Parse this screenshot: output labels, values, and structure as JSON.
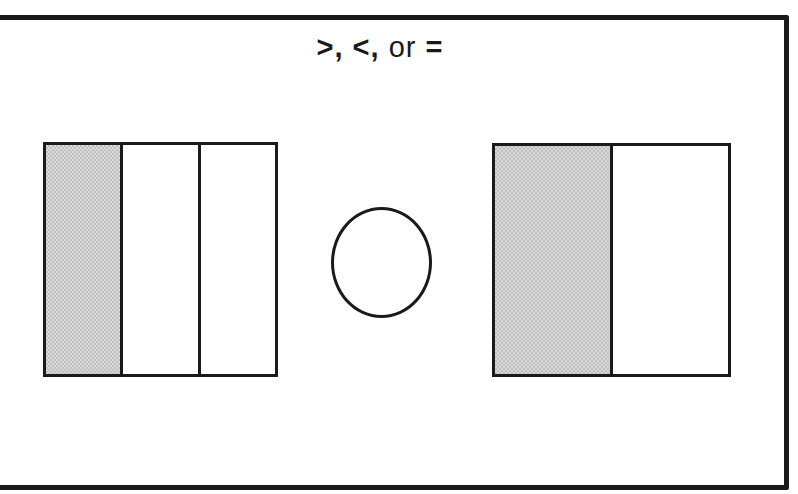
{
  "page": {
    "background": "#ffffff",
    "line_color": "#1a1a1a"
  },
  "header": {
    "title": ">, <, or =",
    "title_parts": [
      {
        "text": ">",
        "weight": "heavy"
      },
      {
        "text": ", ",
        "weight": "medium"
      },
      {
        "text": "<",
        "weight": "heavy"
      },
      {
        "text": ", ",
        "weight": "medium"
      },
      {
        "text": "or ",
        "weight": "regular"
      },
      {
        "text": "=",
        "weight": "heavy"
      }
    ]
  },
  "exercise": {
    "type": "fraction-comparison",
    "left_model": {
      "shape": "square",
      "total_parts": 3,
      "shaded_parts": 1,
      "fraction": "1/3",
      "shaded_fill": "#cbcbcb"
    },
    "answer": {
      "shape": "circle",
      "value": ""
    },
    "right_model": {
      "shape": "square",
      "total_parts": 2,
      "shaded_parts": 1,
      "fraction": "1/2",
      "shaded_fill": "#cbcbcb"
    }
  }
}
